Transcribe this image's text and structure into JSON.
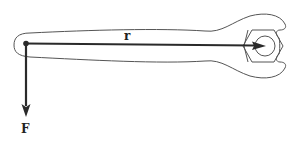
{
  "diagram": {
    "labels": {
      "position_vector": "r",
      "force_vector": "F"
    },
    "elements": [
      {
        "id": "wrench",
        "description": "open-end wrench outline"
      },
      {
        "id": "nut",
        "description": "hexagonal nut with inner circle at wrench head"
      },
      {
        "id": "pivot-point",
        "description": "dot at the left end of the handle where force is applied"
      },
      {
        "id": "r-vector",
        "description": "horizontal arrow from the handle end to the nut center",
        "label": "r"
      },
      {
        "id": "F-vector",
        "description": "vertical downward arrow at the handle end",
        "label": "F"
      }
    ],
    "colors": {
      "outline": "#555555",
      "vector": "#2a2a2a",
      "text": "#222222",
      "background": "#ffffff"
    }
  }
}
